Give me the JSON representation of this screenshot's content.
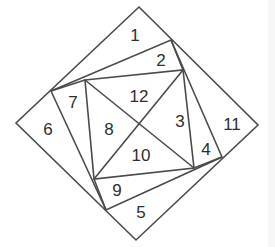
{
  "diagram": {
    "type": "nested-square-dissection",
    "stroke_color": "#4a4a4a",
    "label_color": "#2e2e2e",
    "outer_square": {
      "top": [
        139,
        7
      ],
      "right": [
        258,
        125
      ],
      "bottom": [
        136,
        240
      ],
      "left": [
        16,
        123
      ]
    },
    "middle_quad": {
      "p_top": [
        171,
        40
      ],
      "p_right": [
        222,
        157
      ],
      "p_bottom": [
        106,
        210
      ],
      "p_left": [
        51,
        91
      ]
    },
    "inner_square": {
      "tl": [
        85,
        80
      ],
      "tr": [
        183,
        70
      ],
      "br": [
        194,
        168
      ],
      "bl": [
        94,
        179
      ]
    },
    "labels": [
      {
        "text": "1",
        "x": 135,
        "y": 35
      },
      {
        "text": "2",
        "x": 161,
        "y": 60
      },
      {
        "text": "12",
        "x": 139,
        "y": 96
      },
      {
        "text": "7",
        "x": 73,
        "y": 102
      },
      {
        "text": "6",
        "x": 48,
        "y": 129
      },
      {
        "text": "8",
        "x": 109,
        "y": 129
      },
      {
        "text": "3",
        "x": 180,
        "y": 121
      },
      {
        "text": "11",
        "x": 232,
        "y": 124
      },
      {
        "text": "10",
        "x": 141,
        "y": 155
      },
      {
        "text": "4",
        "x": 206,
        "y": 149
      },
      {
        "text": "9",
        "x": 117,
        "y": 190
      },
      {
        "text": "5",
        "x": 141,
        "y": 212
      }
    ]
  }
}
